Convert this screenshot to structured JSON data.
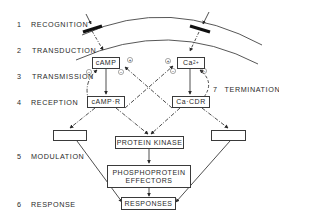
{
  "stages": [
    {
      "num": "1",
      "label": "RECOGNITION"
    },
    {
      "num": "2",
      "label": "TRANSDUCTION"
    },
    {
      "num": "3",
      "label": "TRANSMISSION"
    },
    {
      "num": "4",
      "label": "RECEPTION"
    },
    {
      "num": "5",
      "label": "MODULATION"
    },
    {
      "num": "6",
      "label": "RESPONSE"
    }
  ],
  "termination": {
    "num": "7",
    "label": "TERMINATION"
  },
  "boxes": {
    "camp": "cAMP",
    "calcium_base": "Ca",
    "calcium_sup": "2+",
    "camp_r": "cAMP·R",
    "ca_cdr": "Ca·CDR",
    "protein_kinase": "PROTEIN KINASE",
    "phosphoprotein_line1": "PHOSPHOPROTEIN",
    "phosphoprotein_line2": "EFFECTORS",
    "responses": "RESPONSES",
    "left_modulator": "",
    "right_modulator": ""
  },
  "signs": {
    "plus": "+",
    "minus": "−"
  }
}
